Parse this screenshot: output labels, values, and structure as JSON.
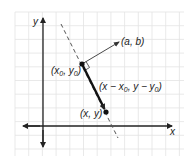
{
  "diagram": {
    "title": "",
    "axes": {
      "x_label": "x",
      "y_label": "y"
    },
    "points": {
      "p0": {
        "label_main": "(x",
        "sub": "0",
        "label_mid": ", y",
        "sub2": "0",
        "label_end": ")"
      },
      "p": {
        "label": "(x, y)"
      },
      "normal": {
        "label": "(a, b)"
      }
    },
    "vector_label": {
      "part1": "(x − x",
      "sub1": "0",
      "part2": ", y − y",
      "sub2": "0",
      "part3": ")"
    },
    "colors": {
      "grid": "#e3e3e3",
      "ink": "#222222",
      "dashed_line": "#555555"
    }
  }
}
